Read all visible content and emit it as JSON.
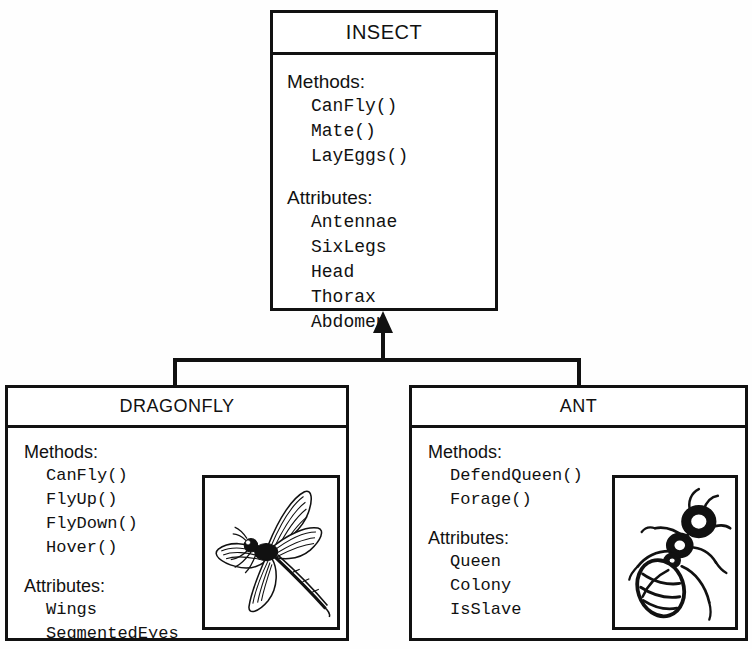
{
  "diagram": {
    "kind": "uml-class-diagram",
    "relationship": "generalization",
    "ink_color": "#111111",
    "background_color": "#ffffff"
  },
  "superclass": {
    "title": "INSECT",
    "methods_label": "Methods:",
    "methods": [
      "CanFly()",
      "Mate()",
      "LayEggs()"
    ],
    "attributes_label": "Attributes:",
    "attributes": [
      "Antennae",
      "SixLegs",
      "Head",
      "Thorax",
      "Abdomen"
    ]
  },
  "subclasses": [
    {
      "title": "DRAGONFLY",
      "methods_label": "Methods:",
      "methods": [
        "CanFly()",
        "FlyUp()",
        "FlyDown()",
        "Hover()"
      ],
      "attributes_label": "Attributes:",
      "attributes": [
        "Wings",
        "SegmentedEyes"
      ],
      "illustration": "dragonfly-illustration"
    },
    {
      "title": "ANT",
      "methods_label": "Methods:",
      "methods": [
        "DefendQueen()",
        "Forage()"
      ],
      "attributes_label": "Attributes:",
      "attributes": [
        "Queen",
        "Colony",
        "IsSlave"
      ],
      "illustration": "ant-illustration"
    }
  ]
}
